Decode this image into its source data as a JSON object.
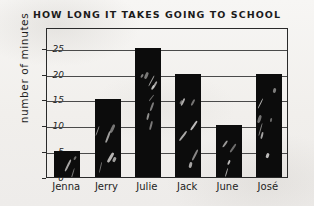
{
  "chart_data": {
    "type": "bar",
    "title": "HOW LONG IT TAKES GOING TO SCHOOL",
    "xlabel": "",
    "ylabel": "number of minutes",
    "categories": [
      "Jenna",
      "Jerry",
      "Julie",
      "Jack",
      "June",
      "José"
    ],
    "values": [
      5,
      15,
      25,
      20,
      10,
      20
    ],
    "ylim": [
      0,
      29
    ],
    "yticks": [
      0,
      5,
      10,
      15,
      20,
      25
    ],
    "ytick_labels": [
      "0",
      "5",
      "10",
      "15",
      "20",
      "25"
    ],
    "grid": true,
    "legend": false,
    "bar_color": "#0c0c0c",
    "axis_color": "#2a2a2a",
    "background_color": "#f4f3f1"
  }
}
